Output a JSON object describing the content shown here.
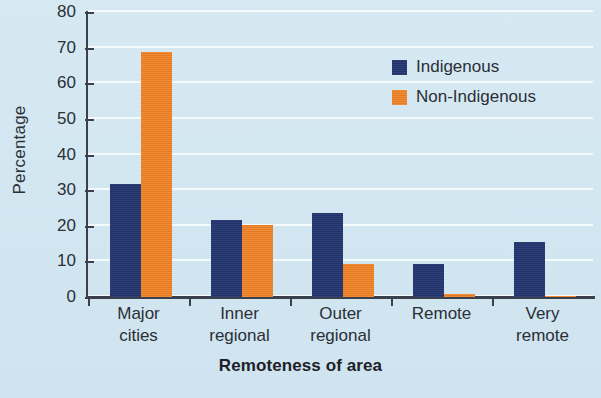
{
  "chart_data": {
    "type": "bar",
    "title": "",
    "xlabel": "Remoteness of area",
    "ylabel": "Percentage",
    "ylim": [
      0,
      80
    ],
    "yticks": [
      0,
      10,
      20,
      30,
      40,
      50,
      60,
      70,
      80
    ],
    "ytick_labels": [
      "0",
      "10",
      "20",
      "30",
      "40",
      "50",
      "60",
      "70",
      "80"
    ],
    "grid": true,
    "legend_position": "upper-right",
    "categories": [
      "Major cities",
      "Inner regional",
      "Outer regional",
      "Remote",
      "Very remote"
    ],
    "category_lines": [
      [
        "Major",
        "cities"
      ],
      [
        "Inner",
        "regional"
      ],
      [
        "Outer",
        "regional"
      ],
      [
        "Remote",
        ""
      ],
      [
        "Very",
        "remote"
      ]
    ],
    "series": [
      {
        "name": "Indigenous",
        "color": "#233570",
        "values": [
          31.8,
          21.5,
          23.5,
          9.3,
          15.4
        ]
      },
      {
        "name": "Non-Indigenous",
        "color": "#ef8023",
        "values": [
          68.8,
          20.1,
          9.2,
          0.8,
          0.4
        ]
      }
    ]
  },
  "colors": {
    "background": "#d6e9f3",
    "axis": "#3a414d",
    "gridline": "#ffffff",
    "indigenous": "#233570",
    "non_indigenous": "#ef8023",
    "text": "#2b2f36"
  }
}
